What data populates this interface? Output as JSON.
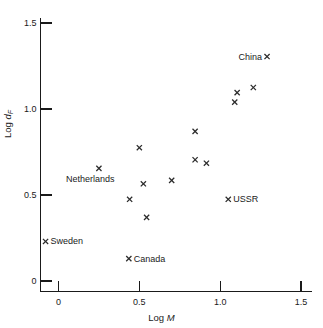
{
  "chart_data": {
    "type": "scatter",
    "title": "",
    "xlabel": "Log M",
    "ylabel": "Log d_F",
    "xlim": [
      -0.1,
      1.55
    ],
    "ylim": [
      -0.06,
      1.58
    ],
    "grid": false,
    "legend": "none",
    "xticks": [
      0,
      0.5,
      1.0,
      1.5
    ],
    "xtick_labels": [
      "0",
      "0.5",
      "1.0",
      "1.5"
    ],
    "yticks": [
      0,
      0.5,
      1.0,
      1.5
    ],
    "ytick_labels": [
      "0",
      "0.5",
      "1.0",
      "1.5"
    ],
    "marker": "x",
    "points": [
      {
        "x": -0.08,
        "y": 0.23,
        "label": "Sweden",
        "label_pos": "right"
      },
      {
        "x": 0.25,
        "y": 0.655,
        "label": "Netherlands",
        "label_pos": "below"
      },
      {
        "x": 0.44,
        "y": 0.475,
        "label": "",
        "label_pos": ""
      },
      {
        "x": 0.435,
        "y": 0.13,
        "label": "Canada",
        "label_pos": "right"
      },
      {
        "x": 0.5,
        "y": 0.775,
        "label": "",
        "label_pos": ""
      },
      {
        "x": 0.525,
        "y": 0.565,
        "label": "",
        "label_pos": ""
      },
      {
        "x": 0.545,
        "y": 0.37,
        "label": "",
        "label_pos": ""
      },
      {
        "x": 0.7,
        "y": 0.585,
        "label": "",
        "label_pos": ""
      },
      {
        "x": 0.845,
        "y": 0.87,
        "label": "",
        "label_pos": ""
      },
      {
        "x": 0.845,
        "y": 0.705,
        "label": "",
        "label_pos": ""
      },
      {
        "x": 0.915,
        "y": 0.685,
        "label": "",
        "label_pos": ""
      },
      {
        "x": 1.05,
        "y": 0.475,
        "label": "USSR",
        "label_pos": "right"
      },
      {
        "x": 1.105,
        "y": 1.095,
        "label": "",
        "label_pos": ""
      },
      {
        "x": 1.09,
        "y": 1.04,
        "label": "",
        "label_pos": ""
      },
      {
        "x": 1.205,
        "y": 1.125,
        "label": "",
        "label_pos": ""
      },
      {
        "x": 1.29,
        "y": 1.305,
        "label": "China",
        "label_pos": "left"
      }
    ],
    "axis_titles": {
      "x_prefix": "Log ",
      "x_symbol": "M",
      "y_prefix": "Log ",
      "y_symbol": "d",
      "y_subscript": "F"
    }
  },
  "colors": {
    "axis": "#1a1a1a",
    "marker": "#2b2b2b",
    "text": "#1a1a1a",
    "background": "#ffffff"
  }
}
